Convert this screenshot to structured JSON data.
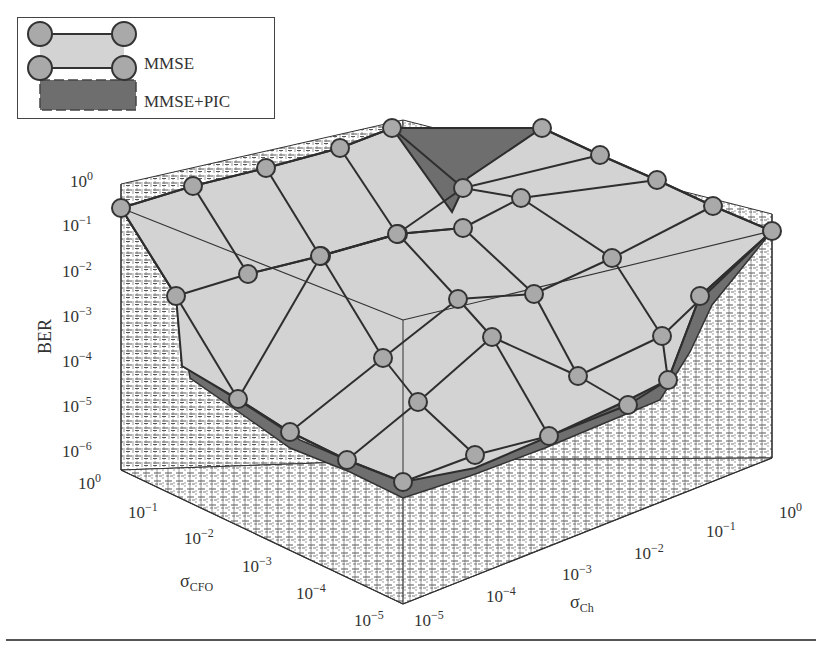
{
  "chart_data": {
    "type": "surface3d",
    "title": "",
    "xlabel": "σ_CFO",
    "ylabel": "σ_Ch",
    "zlabel": "BER",
    "x_ticks": [
      "10^0",
      "10^-1",
      "10^-2",
      "10^-3",
      "10^-4",
      "10^-5"
    ],
    "y_ticks": [
      "10^-5",
      "10^-4",
      "10^-3",
      "10^-2",
      "10^-1",
      "10^0"
    ],
    "z_ticks": [
      "10^0",
      "10^-1",
      "10^-2",
      "10^-3",
      "10^-4",
      "10^-5",
      "10^-6"
    ],
    "zscale": "log",
    "zlim": [
      1e-06,
      1
    ],
    "grid": true,
    "legend_position": "upper-left",
    "series": [
      {
        "name": "MMSE",
        "style": "light-gray surface with circle markers",
        "color": "#d4d4d4",
        "marker_color": "#a8a8a8"
      },
      {
        "name": "MMSE+PIC",
        "style": "dark-gray surface, dashed mesh",
        "color": "#6e6e6e"
      }
    ],
    "note": "BER approaches 10^0 at large σ_CFO or σ_Ch; minimum BER ~10^-5 to 10^-6 near σ_CFO=10^-5, σ_Ch=10^-5. MMSE+PIC is below MMSE in low-error region and slightly above it around σ_CFO≈10^-1, σ_Ch≈10^0 region."
  },
  "legend": {
    "items": [
      {
        "label": "MMSE"
      },
      {
        "label": "MMSE+PIC"
      }
    ]
  },
  "axes": {
    "z_title": "BER",
    "x_title_main": "σ",
    "x_title_sub": "CFO",
    "y_title_main": "σ",
    "y_title_sub": "Ch",
    "z_tick_labels": [
      {
        "base": "10",
        "exp": "0"
      },
      {
        "base": "10",
        "exp": "−1"
      },
      {
        "base": "10",
        "exp": "−2"
      },
      {
        "base": "10",
        "exp": "−3"
      },
      {
        "base": "10",
        "exp": "−4"
      },
      {
        "base": "10",
        "exp": "−5"
      },
      {
        "base": "10",
        "exp": "−6"
      }
    ],
    "x_tick_labels": [
      {
        "base": "10",
        "exp": "0"
      },
      {
        "base": "10",
        "exp": "−1"
      },
      {
        "base": "10",
        "exp": "−2"
      },
      {
        "base": "10",
        "exp": "−3"
      },
      {
        "base": "10",
        "exp": "−4"
      },
      {
        "base": "10",
        "exp": "−5"
      }
    ],
    "y_tick_labels": [
      {
        "base": "10",
        "exp": "−5"
      },
      {
        "base": "10",
        "exp": "−4"
      },
      {
        "base": "10",
        "exp": "−3"
      },
      {
        "base": "10",
        "exp": "−2"
      },
      {
        "base": "10",
        "exp": "−1"
      },
      {
        "base": "10",
        "exp": "0"
      }
    ]
  },
  "colors": {
    "surface_mmse": "#d3d3d3",
    "surface_pic": "#6f6f6f",
    "marker_fill": "#a9a9a9",
    "line": "#2e2e2e",
    "grid": "#3a3a3a"
  }
}
